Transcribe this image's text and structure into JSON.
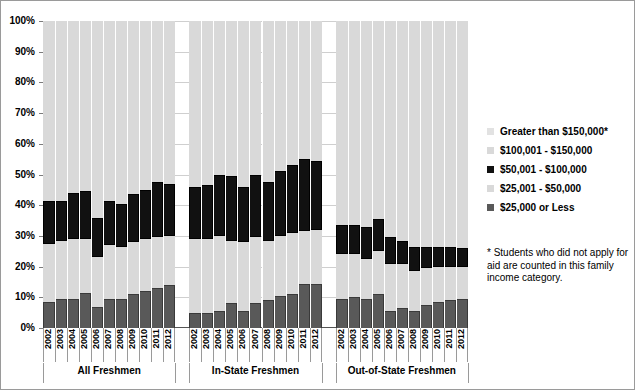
{
  "chart_data": {
    "type": "bar",
    "subtype": "100% stacked bar",
    "title": "",
    "xlabel": "",
    "ylabel": "",
    "ylim": [
      0,
      100
    ],
    "grid": true,
    "legend_position": "right",
    "y_ticks": [
      "0%",
      "10%",
      "20%",
      "30%",
      "40%",
      "50%",
      "60%",
      "70%",
      "80%",
      "90%",
      "100%"
    ],
    "y_tick_values": [
      0,
      10,
      20,
      30,
      40,
      50,
      60,
      70,
      80,
      90,
      100
    ],
    "series": [
      {
        "name": "$25,000 or Less",
        "color": "#595959",
        "order": 1
      },
      {
        "name": "$25,001 - $50,000",
        "color": "#d9d9d9",
        "order": 2
      },
      {
        "name": "$50,001 - $100,000",
        "color": "#111111",
        "order": 3
      },
      {
        "name": "$100,001 - $150,000",
        "color": "#d9d9d9",
        "order": 4
      },
      {
        "name": "Greater than $150,000*",
        "color": "#e2e2e2",
        "order": 5
      }
    ],
    "groups": [
      {
        "name": "All Freshmen",
        "categories": [
          "2002",
          "2003",
          "2004",
          "2005",
          "2006",
          "2007",
          "2008",
          "2009",
          "2010",
          "2011",
          "2012"
        ],
        "values": {
          "$25,000 or Less": [
            8.5,
            9.5,
            9.5,
            11.5,
            7.0,
            9.5,
            9.5,
            11.0,
            12.0,
            13.0,
            14.0
          ],
          "$25,001 - $50,000": [
            19.0,
            19.0,
            19.5,
            17.5,
            16.0,
            17.5,
            17.0,
            17.0,
            17.0,
            16.5,
            16.0
          ],
          "$50,001 - $100,000": [
            14.0,
            13.0,
            15.0,
            15.5,
            13.0,
            14.5,
            14.0,
            15.5,
            16.0,
            18.0,
            17.0
          ],
          "$100,001 - $150,000": [
            58.5,
            58.5,
            56.0,
            55.5,
            64.0,
            58.5,
            59.5,
            56.5,
            55.0,
            52.5,
            53.0
          ]
        }
      },
      {
        "name": "In-State Freshmen",
        "categories": [
          "2002",
          "2003",
          "2004",
          "2005",
          "2006",
          "2007",
          "2008",
          "2009",
          "2010",
          "2011",
          "2012"
        ],
        "values": {
          "$25,000 or Less": [
            5.0,
            5.0,
            5.5,
            8.0,
            5.5,
            8.0,
            9.0,
            10.5,
            11.0,
            14.5,
            14.5
          ],
          "$25,001 - $50,000": [
            24.0,
            24.0,
            24.5,
            20.5,
            22.5,
            21.5,
            19.5,
            19.5,
            20.0,
            17.0,
            17.5
          ],
          "$50,001 - $100,000": [
            17.0,
            17.5,
            20.0,
            21.0,
            18.0,
            20.5,
            19.0,
            21.0,
            22.0,
            23.5,
            22.5
          ],
          "$100,001 - $150,000": [
            54.0,
            53.5,
            50.0,
            50.5,
            54.0,
            50.0,
            52.5,
            49.0,
            47.0,
            45.0,
            45.5
          ]
        }
      },
      {
        "name": "Out-of-State Freshmen",
        "categories": [
          "2002",
          "2003",
          "2004",
          "2005",
          "2006",
          "2007",
          "2008",
          "2009",
          "2010",
          "2011",
          "2012"
        ],
        "values": {
          "$25,000 or Less": [
            9.5,
            10.0,
            9.5,
            11.0,
            5.5,
            6.5,
            5.5,
            7.5,
            8.5,
            9.0,
            9.5
          ],
          "$25,001 - $50,000": [
            14.5,
            14.0,
            13.0,
            14.0,
            15.5,
            14.5,
            13.0,
            12.0,
            11.5,
            11.0,
            10.5
          ],
          "$50,001 - $100,000": [
            9.5,
            9.5,
            10.5,
            10.5,
            8.5,
            7.5,
            8.0,
            7.0,
            6.5,
            6.5,
            6.0
          ],
          "$100,001 - $150,000": [
            66.5,
            66.5,
            67.0,
            64.5,
            70.5,
            71.5,
            73.5,
            73.5,
            73.5,
            73.5,
            74.0
          ]
        }
      }
    ],
    "legend_entries": [
      "Greater than $150,000*",
      "$100,001 - $150,000",
      "$50,001 - $100,000",
      "$25,001 - $50,000",
      "$25,000 or Less"
    ],
    "footnote": "* Students who did not apply for aid are counted in this family income category."
  }
}
